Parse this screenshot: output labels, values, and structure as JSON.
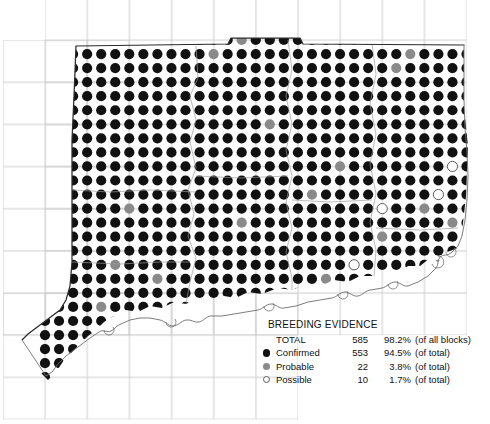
{
  "legend": {
    "title": "BREEDING EVIDENCE",
    "rows": [
      {
        "symbol": "none",
        "label": "TOTAL",
        "count": "585",
        "pct": "98.2%",
        "note": "(of all blocks)"
      },
      {
        "symbol": "confirmed",
        "label": "Confirmed",
        "count": "553",
        "pct": "94.5%",
        "note": "(of total)"
      },
      {
        "symbol": "probable",
        "label": "Probable",
        "count": "22",
        "pct": "3.8%",
        "note": "(of total)"
      },
      {
        "symbol": "possible",
        "label": "Possible",
        "count": "10",
        "pct": "1.7%",
        "note": "(of total)"
      }
    ]
  },
  "colors": {
    "confirmed": "#111111",
    "probable": "#8a8a8a",
    "possible_fill": "#ffffff",
    "possible_stroke": "#5a5a5a",
    "grid": "#c9c9c9",
    "state_border": "#2b2b2b",
    "county_border": "#9a9a9a"
  },
  "chart_data": {
    "type": "scatter",
    "title": "BREEDING EVIDENCE",
    "xlabel": "",
    "ylabel": "",
    "grid": true,
    "legend_position": "bottom-right",
    "categories": [
      "Confirmed",
      "Probable",
      "Possible"
    ],
    "values": [
      553,
      22,
      10
    ],
    "total_blocks_reported": 585,
    "total_pct_of_all_blocks": 98.2,
    "series": [
      {
        "name": "Confirmed",
        "count": 553,
        "pct_of_total": 94.5,
        "color": "#111111"
      },
      {
        "name": "Probable",
        "count": 22,
        "pct_of_total": 3.8,
        "color": "#8a8a8a"
      },
      {
        "name": "Possible",
        "count": 10,
        "pct_of_total": 1.7,
        "color": "#ffffff"
      }
    ],
    "marker_grid": {
      "origin_x": 45,
      "origin_y": 40,
      "step_x": 14.05,
      "step_y": 14.05,
      "radius": 5.1,
      "cols": 31,
      "rows": 25
    },
    "probable_cells": [
      [
        14,
        0
      ],
      [
        12,
        1
      ],
      [
        26,
        1
      ],
      [
        25,
        2
      ],
      [
        19,
        11
      ],
      [
        6,
        12
      ],
      [
        14,
        13
      ],
      [
        5,
        16
      ],
      [
        24,
        14
      ],
      [
        20,
        17
      ],
      [
        28,
        16
      ],
      [
        22,
        18
      ],
      [
        12,
        20
      ],
      [
        17,
        21
      ],
      [
        4,
        19
      ],
      [
        9,
        20
      ],
      [
        27,
        12
      ],
      [
        21,
        9
      ],
      [
        8,
        17
      ],
      [
        16,
        6
      ],
      [
        29,
        13
      ],
      [
        23,
        20
      ]
    ],
    "possible_cells": [
      [
        24,
        12
      ],
      [
        28,
        11
      ],
      [
        22,
        16
      ],
      [
        21,
        19
      ],
      [
        10,
        21
      ],
      [
        7,
        22
      ],
      [
        26,
        17
      ],
      [
        19,
        22
      ],
      [
        29,
        9
      ],
      [
        13,
        22
      ]
    ]
  }
}
